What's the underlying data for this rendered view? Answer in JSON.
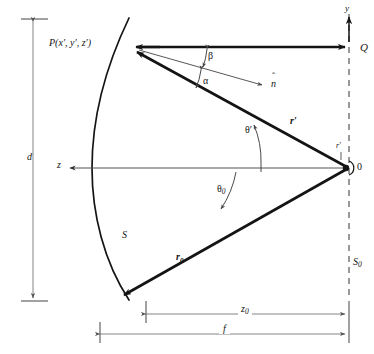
{
  "figure": {
    "type": "parabolic-reflector-geometry-diagram",
    "background_color": "#ffffff",
    "ink_color": "#141414",
    "thin_line_color": "#555555"
  },
  "labels": {
    "point_p": "P(x′, y′, z′)",
    "origin_o": "0",
    "point_q": "Q",
    "axis_y": "y",
    "axis_z": "z",
    "surface_s": "S",
    "aperture_plane_s0_base": "S",
    "aperture_plane_s0_sub": "0",
    "angle_beta": "β",
    "angle_alpha": "α",
    "unit_normal_base": "n",
    "unit_normal_hat": "ˆ",
    "vector_r_prime": "r′",
    "vector_r0_base": "r",
    "vector_r0_sub": "0",
    "angle_theta_prime": "θ′",
    "angle_theta0_base": "θ",
    "angle_theta0_sub": "0",
    "focus_r_prime_small": "r′",
    "dim_d": "d",
    "dim_z0_base": "z",
    "dim_z0_sub": "0",
    "dim_f": "f"
  }
}
